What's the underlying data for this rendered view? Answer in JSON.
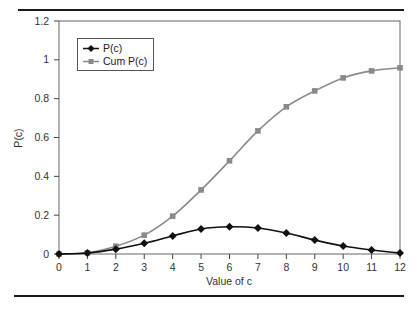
{
  "chart_data": {
    "type": "line",
    "title": "",
    "xlabel": "Value of c",
    "ylabel": "P(c)",
    "x": [
      0,
      1,
      2,
      3,
      4,
      5,
      6,
      7,
      8,
      9,
      10,
      11,
      12
    ],
    "x_tick_labels": [
      "0",
      "1",
      "2",
      "3",
      "4",
      "5",
      "6",
      "7",
      "8",
      "9",
      "10",
      "11",
      "12"
    ],
    "y_tick_labels": [
      "0",
      "0.2",
      "0.4",
      "0.6",
      "0.8",
      "1",
      "1.2"
    ],
    "y_ticks": [
      0,
      0.2,
      0.4,
      0.6,
      0.8,
      1.0,
      1.2
    ],
    "xlim": [
      0,
      12
    ],
    "ylim": [
      0,
      1.2
    ],
    "grid": false,
    "legend_position": "upper-left",
    "series": [
      {
        "name": "P(c)",
        "marker": "diamond",
        "color": "#111111",
        "values": [
          0.0,
          0.005,
          0.025,
          0.055,
          0.093,
          0.129,
          0.14,
          0.134,
          0.108,
          0.072,
          0.041,
          0.021,
          0.005
        ]
      },
      {
        "name": "Cum P(c)",
        "marker": "square",
        "color": "#8a8a8a",
        "values": [
          0.0,
          0.006,
          0.04,
          0.097,
          0.195,
          0.33,
          0.48,
          0.634,
          0.758,
          0.84,
          0.907,
          0.943,
          0.959
        ]
      }
    ]
  },
  "legend": {
    "items": [
      {
        "label": "P(c)"
      },
      {
        "label": "Cum P(c)"
      }
    ]
  }
}
